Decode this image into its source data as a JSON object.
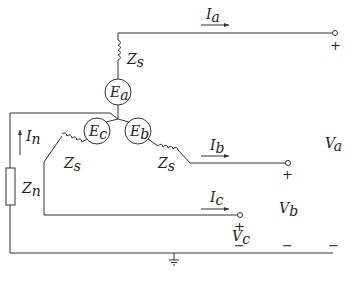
{
  "diagram": {
    "type": "three-phase wye-connected generator circuit with neutral impedance to ground",
    "generators": [
      {
        "id": "Ea",
        "label": "E",
        "sub": "a"
      },
      {
        "id": "Eb",
        "label": "E",
        "sub": "b"
      },
      {
        "id": "Ec",
        "label": "E",
        "sub": "c"
      }
    ],
    "impedances": {
      "series_a": {
        "label": "Z",
        "sub": "s"
      },
      "series_b": {
        "label": "Z",
        "sub": "s"
      },
      "series_c": {
        "label": "Z",
        "sub": "s"
      },
      "neutral": {
        "label": "Z",
        "sub": "n"
      }
    },
    "currents": {
      "a": {
        "label": "I",
        "sub": "a"
      },
      "b": {
        "label": "I",
        "sub": "b"
      },
      "c": {
        "label": "I",
        "sub": "c"
      },
      "n": {
        "label": "I",
        "sub": "n"
      }
    },
    "voltages": {
      "a": {
        "label": "V",
        "sub": "a",
        "plus": "+",
        "minus": "−"
      },
      "b": {
        "label": "V",
        "sub": "b",
        "plus": "+",
        "minus": "−"
      },
      "c": {
        "label": "V",
        "sub": "c",
        "plus": "+",
        "minus": "−"
      }
    },
    "ground": "ground-symbol"
  }
}
